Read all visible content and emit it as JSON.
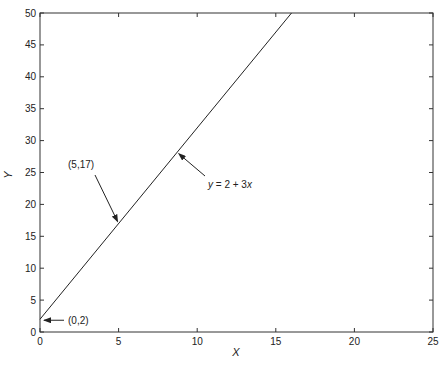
{
  "chart_data": {
    "type": "line",
    "title": "",
    "xlabel": "X",
    "ylabel": "Y",
    "xlim": [
      0,
      25
    ],
    "ylim": [
      0,
      50
    ],
    "xticks": [
      0,
      5,
      10,
      15,
      20,
      25
    ],
    "yticks": [
      0,
      5,
      10,
      15,
      20,
      25,
      30,
      35,
      40,
      45,
      50
    ],
    "grid": false,
    "legend": null,
    "series": [
      {
        "name": "y = 2 + 3x",
        "x": [
          0,
          16
        ],
        "y": [
          2,
          50
        ],
        "color": "#222222"
      }
    ],
    "annotations": [
      {
        "text": "(0,2)",
        "point": [
          0,
          2
        ]
      },
      {
        "text": "(5,17)",
        "point": [
          5,
          17
        ]
      },
      {
        "text": "y = 2 + 3x",
        "point": [
          8.7,
          28.1
        ]
      }
    ]
  },
  "labels": {
    "x_axis": "X",
    "y_axis": "Y",
    "annot_origin": "(0,2)",
    "annot_point": "(5,17)",
    "annot_eq_y": "y",
    "annot_eq_mid": " = 2 + 3",
    "annot_eq_x": "x"
  }
}
